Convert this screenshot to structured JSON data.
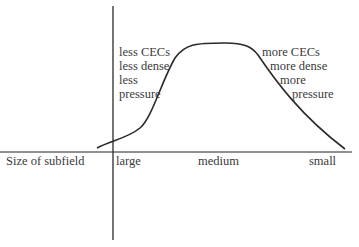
{
  "diagram": {
    "type": "curve-diagram",
    "x_axis_label": "Size of subfield",
    "x_ticks": [
      "large",
      "medium",
      "small"
    ],
    "left_annotation": [
      "less CECs",
      "less dense",
      "less",
      "pressure"
    ],
    "right_annotation": [
      "more CECs",
      "more dense",
      "more",
      "pressure"
    ],
    "curve": "bell-shaped curve rising from large to a plateau at medium and falling toward small",
    "colors": {
      "axis": "#555555",
      "curve": "#2a2a2a",
      "text": "#3a3a3a"
    }
  }
}
